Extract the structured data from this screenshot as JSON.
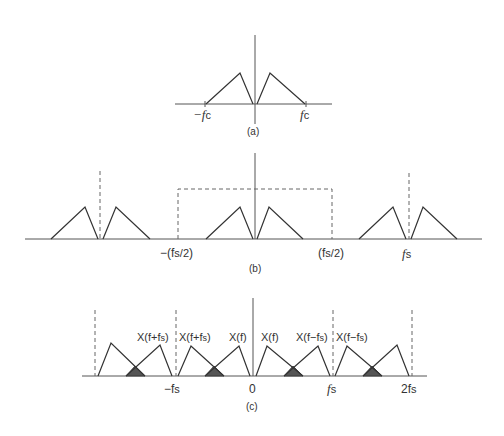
{
  "panels": {
    "a": {
      "caption": "(a)",
      "labels": {
        "neg_fc": "−f",
        "neg_fc_sub": "c",
        "pos_fc": "f",
        "pos_fc_sub": "c"
      }
    },
    "b": {
      "caption": "(b)",
      "labels": {
        "neg_half_fs": "−(f",
        "neg_half_fs_sub": "s/2",
        "neg_half_close": ")",
        "pos_half_fs": "(f",
        "pos_half_fs_sub": "s/2",
        "pos_half_close": ")",
        "fs": "f",
        "fs_sub": "s"
      }
    },
    "c": {
      "caption": "(c)",
      "labels": {
        "x_f_plus_fs_1": "X(f+f",
        "x_f_plus_fs_2": "X(f+f",
        "x_f_1": "X(f)",
        "x_f_2": "X(f)",
        "x_f_minus_fs_1": "X(f−f",
        "x_f_minus_fs_2": "X(f−f",
        "sub_s": "s",
        "close": ")",
        "neg_fs": "−f",
        "zero": "0",
        "fs": "f",
        "two_fs": "2f",
        "sub": "s"
      }
    }
  },
  "colors": {
    "line": "#333333",
    "axis": "#555555",
    "shade": "#555555",
    "background": "#ffffff"
  }
}
